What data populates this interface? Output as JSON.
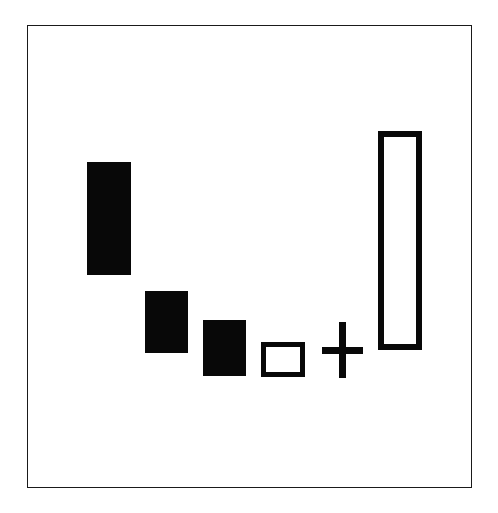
{
  "figure": {
    "title": "",
    "background_color": "#ffffff",
    "ink_color": "#080808",
    "frame": {
      "name": "plot-frame",
      "x": 27,
      "y": 25,
      "width": 445,
      "height": 463,
      "stroke_width": 1.6,
      "stroke_color": "#1a1a1a",
      "fill": "#ffffff"
    }
  },
  "chart_data": {
    "type": "bar",
    "title": "",
    "subtitle": "",
    "xlabel": "",
    "ylabel": "",
    "grid": false,
    "legend": null,
    "axis_visible": false,
    "tick_labels_x": [],
    "tick_labels_y": [],
    "categories": [
      "1",
      "2",
      "3",
      "4",
      "5",
      "6"
    ],
    "marks": [
      {
        "id": "bar-1",
        "role": "floating-bar",
        "style": "filled",
        "category": "1",
        "x": 87,
        "y": 162,
        "width": 44,
        "height": 113,
        "top_value": 113,
        "bottom_value": 0,
        "fill": "#080808",
        "stroke": "none",
        "stroke_width": 0
      },
      {
        "id": "bar-2",
        "role": "floating-bar",
        "style": "filled",
        "category": "2",
        "x": 145,
        "y": 291,
        "width": 43,
        "height": 62,
        "top_value": 62,
        "bottom_value": 0,
        "fill": "#080808",
        "stroke": "none",
        "stroke_width": 0
      },
      {
        "id": "bar-3",
        "role": "floating-bar",
        "style": "filled",
        "category": "3",
        "x": 203,
        "y": 320,
        "width": 43,
        "height": 56,
        "top_value": 56,
        "bottom_value": 0,
        "fill": "#080808",
        "stroke": "none",
        "stroke_width": 0
      },
      {
        "id": "bar-4",
        "role": "floating-bar",
        "style": "hollow",
        "category": "4",
        "x": 261,
        "y": 342,
        "width": 44,
        "height": 35,
        "top_value": 35,
        "bottom_value": 0,
        "fill": "#ffffff",
        "stroke": "#080808",
        "stroke_width": 5
      },
      {
        "id": "operator-plus",
        "role": "operator",
        "style": "glyph",
        "glyph": "plus",
        "category": "5",
        "x": 322,
        "y": 322,
        "width": 41,
        "height": 56,
        "stroke": "#080808",
        "stroke_width": 7
      },
      {
        "id": "bar-total",
        "role": "total-bar",
        "style": "hollow",
        "category": "6",
        "x": 378,
        "y": 131,
        "width": 44,
        "height": 219,
        "top_value": 219,
        "bottom_value": 0,
        "fill": "#ffffff",
        "stroke": "#080808",
        "stroke_width": 6
      }
    ],
    "values": [
      113,
      62,
      56,
      35,
      null,
      219
    ],
    "series": [
      {
        "name": "bar-height-px",
        "values": [
          113,
          62,
          56,
          35,
          null,
          219
        ]
      },
      {
        "name": "bar-top-y-px",
        "values": [
          162,
          291,
          320,
          342,
          322,
          131
        ]
      },
      {
        "name": "bar-bottom-y-px",
        "values": [
          275,
          353,
          376,
          377,
          378,
          350
        ]
      }
    ],
    "annotations": []
  }
}
